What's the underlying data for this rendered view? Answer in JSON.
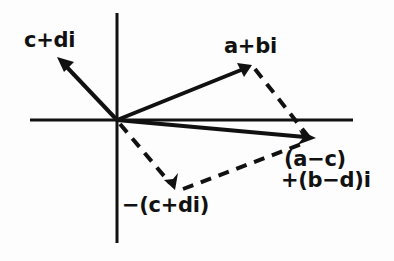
{
  "figure": {
    "name": "complex-number-subtraction-argand-diagram",
    "background_color": "#fdfdfd",
    "stroke_color": "#111111",
    "labels": {
      "c_plus_di": "c+di",
      "a_plus_bi": "a+bi",
      "neg_c_plus_di": "−(c+di)",
      "result_line1": "(a−c)",
      "result_line2": "+(b−d)i"
    },
    "axes": {
      "origin": {
        "x": 117,
        "y": 120
      },
      "horizontal": {
        "x1": 30,
        "y1": 120,
        "x2": 353,
        "y2": 120
      },
      "vertical": {
        "x1": 117,
        "y1": 13,
        "x2": 117,
        "y2": 243
      }
    },
    "vectors": [
      {
        "name": "vector-c-plus-di",
        "style": "solid",
        "label": "c+di",
        "from": {
          "x": 117,
          "y": 120
        },
        "to": {
          "x": 57,
          "y": 57
        }
      },
      {
        "name": "vector-a-plus-bi",
        "style": "solid",
        "label": "a+bi",
        "from": {
          "x": 117,
          "y": 120
        },
        "to": {
          "x": 252,
          "y": 65
        }
      },
      {
        "name": "vector-result",
        "style": "solid",
        "label": "(a−c)+(b−d)i",
        "from": {
          "x": 117,
          "y": 120
        },
        "to": {
          "x": 314,
          "y": 138
        }
      },
      {
        "name": "vector-neg-c-plus-di",
        "style": "dashed",
        "label": "−(c+di)",
        "from": {
          "x": 117,
          "y": 120
        },
        "to": {
          "x": 175,
          "y": 190
        }
      }
    ],
    "construction_lines": [
      {
        "name": "dashed-a-plus-bi-to-result",
        "style": "dashed",
        "from": {
          "x": 254,
          "y": 68
        },
        "to": {
          "x": 311,
          "y": 140
        }
      },
      {
        "name": "dashed-neg-c-to-result",
        "style": "dashed",
        "from": {
          "x": 183,
          "y": 189
        },
        "to": {
          "x": 309,
          "y": 141
        }
      }
    ]
  }
}
